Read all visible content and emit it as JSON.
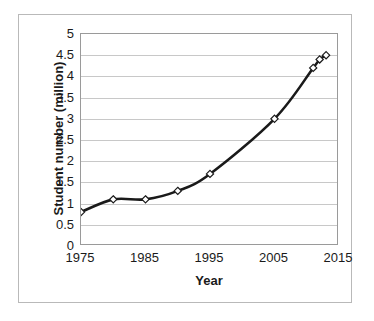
{
  "chart_data": {
    "type": "line",
    "title": "",
    "xlabel": "Year",
    "ylabel": "Student number (million)",
    "xlim": [
      1975,
      2015
    ],
    "ylim": [
      0,
      5
    ],
    "grid": true,
    "legend": null,
    "xticks": [
      "1975",
      "1985",
      "1995",
      "2005",
      "2015"
    ],
    "xtick_values": [
      1975,
      1985,
      1995,
      2005,
      2015
    ],
    "yticks": [
      "0",
      "0.5",
      "1",
      "1.5",
      "2",
      "2.5",
      "3",
      "3.5",
      "4",
      "4.5",
      "5"
    ],
    "ytick_values": [
      0,
      0.5,
      1,
      1.5,
      2,
      2.5,
      3,
      3.5,
      4,
      4.5,
      5
    ],
    "series": [
      {
        "name": "Student number",
        "marker": "diamond-open",
        "line_color": "#1a1a1a",
        "x": [
          1975,
          1980,
          1985,
          1990,
          1995,
          2005,
          2011,
          2012,
          2013
        ],
        "values": [
          0.8,
          1.1,
          1.1,
          1.3,
          1.7,
          3.0,
          4.2,
          4.4,
          4.5
        ]
      }
    ],
    "colors": {
      "line": "#1a1a1a",
      "gridline": "#c8c8c8",
      "axis": "#9a9a9a",
      "border": "#b9b9b9",
      "background": "#ffffff",
      "text": "#1a1a1a"
    }
  }
}
